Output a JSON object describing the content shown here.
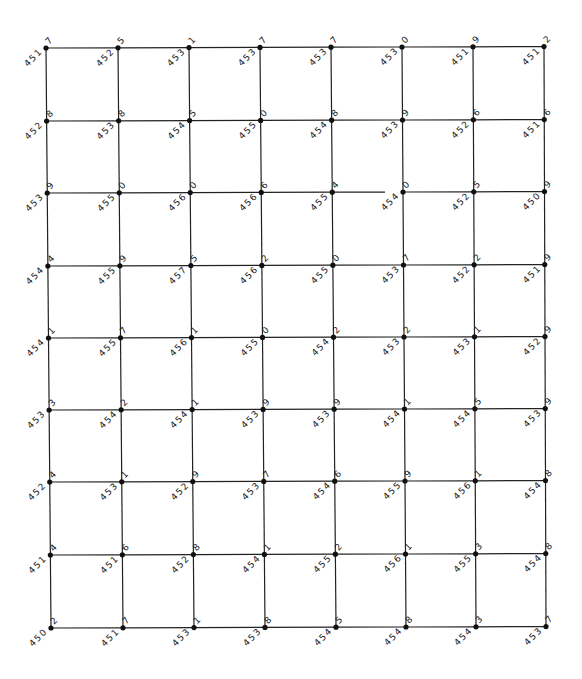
{
  "diagram": {
    "type": "spot-elevation-grid",
    "rows": 9,
    "cols": 8,
    "col_x": [
      [
        46,
        51
      ],
      [
        118,
        123
      ],
      [
        189,
        194
      ],
      [
        260,
        265
      ],
      [
        331,
        336
      ],
      [
        402,
        406
      ],
      [
        473,
        476
      ],
      [
        544,
        546
      ]
    ],
    "row_y": [
      48,
      121,
      193,
      266,
      338,
      410,
      482,
      555,
      628
    ],
    "line_color": "#222222",
    "node_color": "#111111",
    "gaps": [
      {
        "row": 2,
        "from_col": 4,
        "to_col": 5,
        "gap_start_x": 385
      }
    ],
    "elevations": [
      [
        "451.7",
        "452.5",
        "453.1",
        "453.7",
        "453.7",
        "453.0",
        "451.9",
        "451.2"
      ],
      [
        "452.8",
        "453.8",
        "454.5",
        "455.0",
        "454.8",
        "453.9",
        "452.6",
        "451.6"
      ],
      [
        "453.9",
        "455.0",
        "456.0",
        "456.6",
        "455.4",
        "454.0",
        "452.5",
        "450.9"
      ],
      [
        "454.4",
        "455.9",
        "457.5",
        "456.2",
        "455.0",
        "453.7",
        "452.2",
        "451.9"
      ],
      [
        "454.1",
        "455.7",
        "456.1",
        "455.0",
        "454.2",
        "453.2",
        "453.1",
        "452.9"
      ],
      [
        "453.3",
        "454.2",
        "454.1",
        "453.9",
        "453.9",
        "454.1",
        "454.5",
        "453.9"
      ],
      [
        "452.4",
        "453.1",
        "452.9",
        "453.7",
        "454.6",
        "455.9",
        "456.1",
        "454.8"
      ],
      [
        "451.4",
        "451.6",
        "452.8",
        "454.1",
        "455.2",
        "456.1",
        "455.3",
        "454.8"
      ],
      [
        "450.2",
        "451.7",
        "453.1",
        "453.8",
        "454.5",
        "454.8",
        "454.3",
        "453.7"
      ]
    ]
  }
}
